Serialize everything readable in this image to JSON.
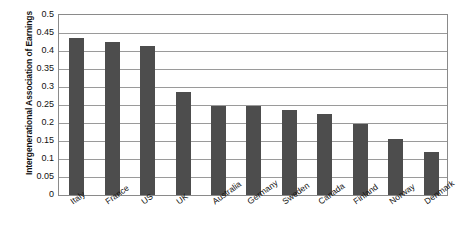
{
  "chart_data": {
    "type": "bar",
    "title": "",
    "subtitle": "",
    "xlabel": "",
    "ylabel": "Intergenerational Association of Earnings",
    "ylim": [
      0,
      0.5
    ],
    "ytick_step": 0.05,
    "ytick_labels": [
      "0.5",
      "0.45",
      "0.4",
      "0.35",
      "0.3",
      "0.25",
      "0.2",
      "0.15",
      "0.1",
      "0.05",
      "0"
    ],
    "ytick_values": [
      0.5,
      0.45,
      0.4,
      0.35,
      0.3,
      0.25,
      0.2,
      0.15,
      0.1,
      0.05,
      0
    ],
    "grid": true,
    "legend": "none",
    "bar_color": "#4d4d4d",
    "plot_border_color": "#8a8a8a",
    "gridline_color": "#9a9a9a",
    "background_color": "#ffffff",
    "categories": [
      "Italy",
      "France",
      "US",
      "UK",
      "Australia",
      "Germany",
      "Sweden",
      "Canada",
      "Finland",
      "Norway",
      "Denmark"
    ],
    "values": [
      0.435,
      0.425,
      0.415,
      0.285,
      0.247,
      0.247,
      0.237,
      0.225,
      0.198,
      0.155,
      0.12
    ]
  }
}
